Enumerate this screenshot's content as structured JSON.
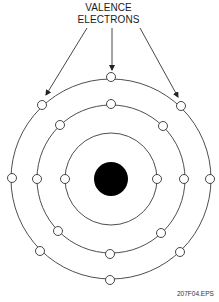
{
  "title": {
    "line1": "VALENCE",
    "line2": "ELECTRONS"
  },
  "caption": "207F04.EPS",
  "diagram": {
    "type": "atom-bohr-model",
    "nucleus": {
      "cx": 111,
      "cy": 179,
      "r": 17,
      "fill": "#000000"
    },
    "shells": [
      {
        "name": "inner",
        "r": 46,
        "electrons": 2
      },
      {
        "name": "middle",
        "r": 74,
        "electrons": 8
      },
      {
        "name": "outer",
        "r": 100,
        "electrons": 8,
        "label": "valence"
      }
    ],
    "arrows_point_to": [
      "outer-upper-left",
      "outer-top",
      "outer-upper-right"
    ],
    "colors": {
      "line": "#3a3a3a",
      "electron_fill": "#ffffff",
      "nucleus": "#000000"
    }
  }
}
